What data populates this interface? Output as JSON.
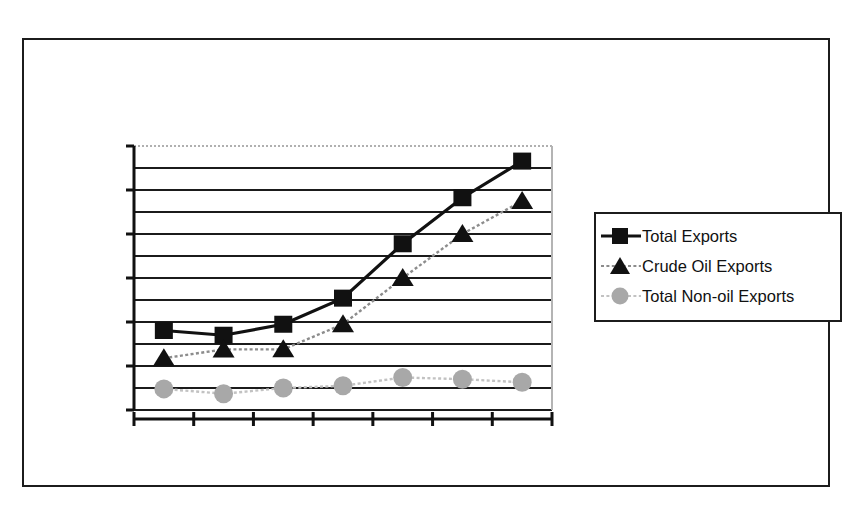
{
  "chart_data": {
    "type": "line",
    "title": "Sudanese Exports, 2000-2006",
    "subtitle": "Source:  Central Bank of Sudan",
    "xlabel": "",
    "ylabel": "Millions USD",
    "categories": [
      "2000",
      "2001",
      "2002",
      "2003",
      "2004",
      "2005",
      "2006"
    ],
    "ylim": [
      0,
      6000
    ],
    "ytick_labels": [
      "0",
      "1,000",
      "2,000",
      "3,000",
      "4,000",
      "5,000",
      "6,000"
    ],
    "ytick_values": [
      0,
      1000,
      2000,
      3000,
      4000,
      5000,
      6000
    ],
    "minor_tick_step": 500,
    "grid": "horizontal-major-and-minor",
    "legend_position": "right",
    "series": [
      {
        "name": "Total Exports",
        "marker": "square",
        "marker_color": "#111111",
        "line_color": "#111111",
        "line_style": "solid",
        "values": [
          1807,
          1699,
          1949,
          2542,
          3778,
          4824,
          5657
        ]
      },
      {
        "name": "Crude Oil Exports",
        "marker": "triangle",
        "marker_color": "#111111",
        "line_color": "#8c8c8c",
        "line_style": "dotted",
        "values": [
          1177,
          1377,
          1378,
          1950,
          3000,
          4000,
          4750
        ]
      },
      {
        "name": "Total Non-oil Exports",
        "marker": "circle",
        "marker_color": "#a8a8a8",
        "line_color": "#c2c2c2",
        "line_style": "dotted",
        "values": [
          480,
          370,
          500,
          550,
          740,
          700,
          630
        ]
      }
    ]
  },
  "legend": {
    "items": [
      {
        "label": "Total Exports"
      },
      {
        "label": "Crude Oil Exports"
      },
      {
        "label": "Total Non-oil Exports"
      }
    ]
  }
}
